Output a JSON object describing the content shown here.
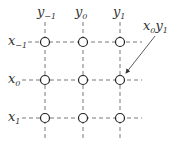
{
  "columns": [
    {
      "label": "y",
      "sub": "−1"
    },
    {
      "label": "y",
      "sub": "0"
    },
    {
      "label": "y",
      "sub": "1"
    }
  ],
  "rows": [
    {
      "label": "x",
      "sub": "−1"
    },
    {
      "label": "x",
      "sub": "0"
    },
    {
      "label": "x",
      "sub": "1"
    }
  ],
  "annotation": {
    "text": "x",
    "sub1": "0",
    "text2": "y",
    "sub2": "1",
    "target_row": 1,
    "target_col": 2
  },
  "colors": {
    "line": "#555555",
    "circle": "#222222"
  }
}
